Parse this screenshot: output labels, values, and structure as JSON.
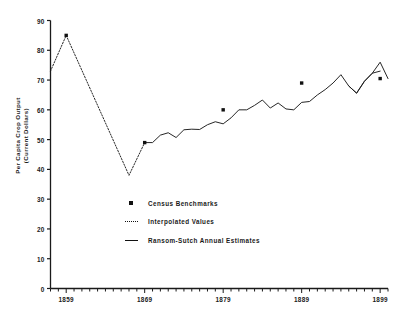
{
  "chart_data": {
    "type": "line",
    "title": "",
    "xlabel": "",
    "ylabel": "Per Capita Crop Output\n(Current Dollars)",
    "ylim": [
      0,
      90
    ],
    "xlim": [
      1857,
      1900
    ],
    "grid": false,
    "legend_position": "center",
    "ytick_labels": [
      "0",
      "10",
      "20",
      "30",
      "40",
      "50",
      "60",
      "70",
      "80",
      "90"
    ],
    "ytick_values": [
      0,
      10,
      20,
      30,
      40,
      50,
      60,
      70,
      80,
      90
    ],
    "xtick_labels": [
      "1859",
      "1869",
      "1879",
      "1889",
      "1899"
    ],
    "xtick_values": [
      1859,
      1869,
      1879,
      1889,
      1899
    ],
    "legend": [
      {
        "label": "Census Benchmarks",
        "marker": "square"
      },
      {
        "label": "Interpolated Values",
        "marker": "dotted-line"
      },
      {
        "label": "Ransom-Sutch Annual Estimates",
        "marker": "solid-line"
      }
    ],
    "series": [
      {
        "name": "Interpolated Values",
        "style": "dotted",
        "x": [
          1857,
          1859,
          1867,
          1869
        ],
        "values": [
          73.0,
          85.0,
          38.0,
          49.0
        ]
      },
      {
        "name": "Ransom-Sutch Annual Estimates",
        "style": "solid",
        "x": [
          1869,
          1870,
          1871,
          1872,
          1873,
          1874,
          1875,
          1876,
          1877,
          1878,
          1879,
          1880,
          1881,
          1882,
          1883,
          1884,
          1885,
          1886,
          1887,
          1888,
          1889,
          1890,
          1891,
          1892,
          1893,
          1894,
          1895,
          1896,
          1897,
          1898,
          1899
        ],
        "values": [
          49.0,
          49.0,
          51.5,
          52.3,
          50.7,
          53.3,
          53.5,
          53.4,
          55.0,
          56.0,
          55.3,
          57.3,
          60.0,
          60.0,
          61.5,
          63.3,
          60.6,
          62.3,
          60.3,
          60.0,
          62.5,
          62.8,
          65.0,
          66.8,
          69.0,
          71.8,
          68.0,
          65.6,
          69.6,
          72.3,
          73.0
        ]
      },
      {
        "name": "Ransom-Sutch Annual Estimates tail",
        "style": "solid",
        "x": [
          1895,
          1896,
          1897,
          1898,
          1899,
          1900
        ],
        "values": [
          68.0,
          65.6,
          69.6,
          72.3,
          76.0,
          70.5
        ]
      }
    ],
    "benchmarks": [
      {
        "x": 1859,
        "y": 85.0
      },
      {
        "x": 1869,
        "y": 49.0
      },
      {
        "x": 1879,
        "y": 60.0
      },
      {
        "x": 1889,
        "y": 69.0
      },
      {
        "x": 1899,
        "y": 70.5
      }
    ]
  }
}
